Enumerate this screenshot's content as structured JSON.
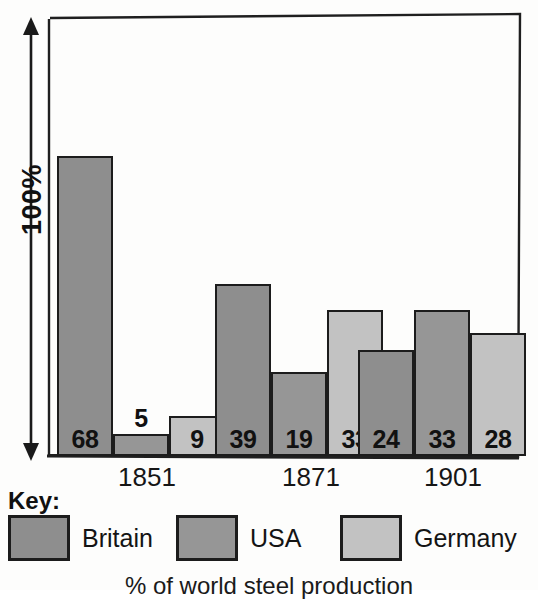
{
  "axis": {
    "label": "100%",
    "arrow_icon": "double-arrow-vertical-icon"
  },
  "caption": "% of world steel production",
  "legend": {
    "title": "Key:",
    "items": [
      {
        "label": "Britain",
        "color": "#8e8e8e"
      },
      {
        "label": "USA",
        "color": "#969696"
      },
      {
        "label": "Germany",
        "color": "#c2c2c2"
      }
    ]
  },
  "chart_data": {
    "type": "bar",
    "title": "",
    "subtitle": "",
    "xlabel": "",
    "ylabel": "100%",
    "caption": "% of world steel production",
    "categories": [
      "1851",
      "1871",
      "1901"
    ],
    "ylim": [
      0,
      100
    ],
    "grid": false,
    "legend_position": "bottom",
    "value_labels": true,
    "series": [
      {
        "name": "Britain",
        "color": "#8e8e8e",
        "values": [
          68,
          39,
          24
        ]
      },
      {
        "name": "USA",
        "color": "#969696",
        "values": [
          5,
          19,
          33
        ]
      },
      {
        "name": "Germany",
        "color": "#c2c2c2",
        "values": [
          9,
          33,
          28
        ]
      }
    ],
    "bars": [
      {
        "group": "1851",
        "series": "Britain",
        "value": 68,
        "label": "68",
        "label_inside": true
      },
      {
        "group": "1851",
        "series": "USA",
        "value": 5,
        "label": "5",
        "label_inside": false
      },
      {
        "group": "1851",
        "series": "Germany",
        "value": 9,
        "label": "9",
        "label_inside": true
      },
      {
        "group": "1871",
        "series": "Britain",
        "value": 39,
        "label": "39",
        "label_inside": true
      },
      {
        "group": "1871",
        "series": "USA",
        "value": 19,
        "label": "19",
        "label_inside": true
      },
      {
        "group": "1871",
        "series": "Germany",
        "value": 33,
        "label": "33",
        "label_inside": true
      },
      {
        "group": "1901",
        "series": "Britain",
        "value": 24,
        "label": "24",
        "label_inside": true
      },
      {
        "group": "1901",
        "series": "USA",
        "value": 33,
        "label": "33",
        "label_inside": true
      },
      {
        "group": "1901",
        "series": "Germany",
        "value": 28,
        "label": "28",
        "label_inside": true
      }
    ]
  },
  "x_labels": [
    {
      "text": "1851",
      "x": 118
    },
    {
      "text": "1871",
      "x": 282
    },
    {
      "text": "1901",
      "x": 424
    }
  ]
}
